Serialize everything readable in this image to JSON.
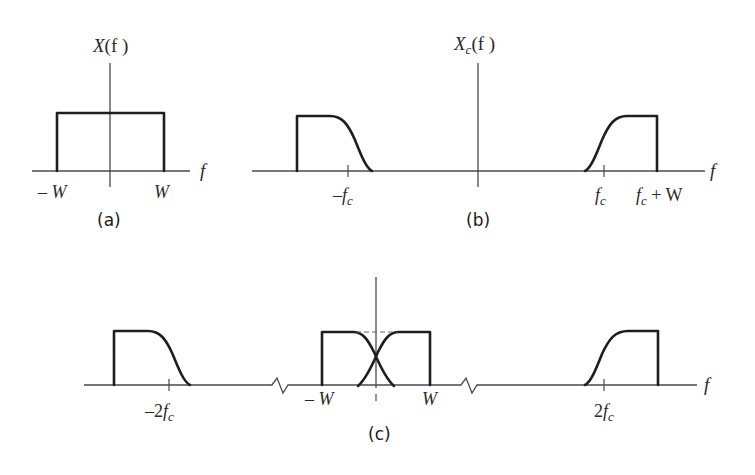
{
  "figure": {
    "panels": [
      {
        "id": "a",
        "caption": "(a)",
        "title_main": "X",
        "title_sub": "",
        "title_arg": "(f )",
        "axis_label": "f",
        "ticks": [
          {
            "label_prefix": "– ",
            "label_main": "W",
            "label_sub": ""
          },
          {
            "label_prefix": "",
            "label_main": "W",
            "label_sub": ""
          }
        ]
      },
      {
        "id": "b",
        "caption": "(b)",
        "title_main": "X",
        "title_sub": "c",
        "title_arg": "(f )",
        "axis_label": "f",
        "ticks": [
          {
            "label_prefix": "–",
            "label_main": "f",
            "label_sub": "c",
            "label_suffix": ""
          },
          {
            "label_prefix": "",
            "label_main": "f",
            "label_sub": "c",
            "label_suffix": ""
          },
          {
            "label_prefix": "",
            "label_main": "f",
            "label_sub": "c",
            "label_suffix": " + W"
          }
        ]
      },
      {
        "id": "c",
        "caption": "(c)",
        "axis_label": "f",
        "ticks": [
          {
            "label_prefix": "–2",
            "label_main": "f",
            "label_sub": "c"
          },
          {
            "label_prefix": "– ",
            "label_main": "W",
            "label_sub": ""
          },
          {
            "label_prefix": "",
            "label_main": "W",
            "label_sub": ""
          },
          {
            "label_prefix": "2",
            "label_main": "f",
            "label_sub": "c"
          }
        ],
        "axis_breaks": 2
      }
    ],
    "colors": {
      "curve": "#1e1e1e",
      "axis": "#4a4a4a",
      "background": "#ffffff"
    }
  }
}
